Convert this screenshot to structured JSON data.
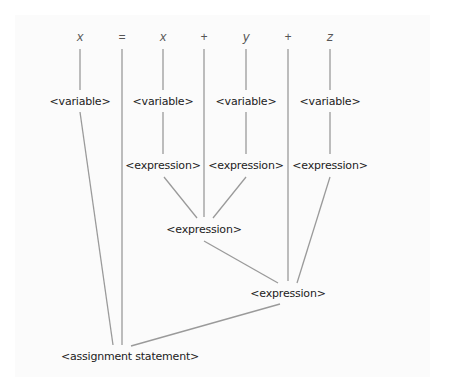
{
  "diagram": {
    "type": "parse tree",
    "tokens": [
      {
        "id": "t1",
        "label": "x",
        "kind": "variable"
      },
      {
        "id": "t2",
        "label": "=",
        "kind": "operator"
      },
      {
        "id": "t3",
        "label": "x",
        "kind": "variable"
      },
      {
        "id": "t4",
        "label": "+",
        "kind": "operator"
      },
      {
        "id": "t5",
        "label": "y",
        "kind": "variable"
      },
      {
        "id": "t6",
        "label": "+",
        "kind": "operator"
      },
      {
        "id": "t7",
        "label": "z",
        "kind": "variable"
      }
    ],
    "nodes": [
      {
        "id": "v1",
        "label": "<variable>"
      },
      {
        "id": "v2",
        "label": "<variable>"
      },
      {
        "id": "v3",
        "label": "<variable>"
      },
      {
        "id": "v4",
        "label": "<variable>"
      },
      {
        "id": "e1",
        "label": "<expression>"
      },
      {
        "id": "e2",
        "label": "<expression>"
      },
      {
        "id": "e3",
        "label": "<expression>"
      },
      {
        "id": "e4",
        "label": "<expression>"
      },
      {
        "id": "e5",
        "label": "<expression>"
      },
      {
        "id": "root",
        "label": "<assignment statement>"
      }
    ],
    "edges": [
      [
        "t1",
        "v1"
      ],
      [
        "t3",
        "v2"
      ],
      [
        "t5",
        "v3"
      ],
      [
        "t7",
        "v4"
      ],
      [
        "v2",
        "e1"
      ],
      [
        "v3",
        "e2"
      ],
      [
        "v4",
        "e3"
      ],
      [
        "e1",
        "e4"
      ],
      [
        "t4",
        "e4"
      ],
      [
        "e2",
        "e4"
      ],
      [
        "e4",
        "e5"
      ],
      [
        "t6",
        "e5"
      ],
      [
        "e3",
        "e5"
      ],
      [
        "v1",
        "root"
      ],
      [
        "t2",
        "root"
      ],
      [
        "e5",
        "root"
      ]
    ]
  }
}
